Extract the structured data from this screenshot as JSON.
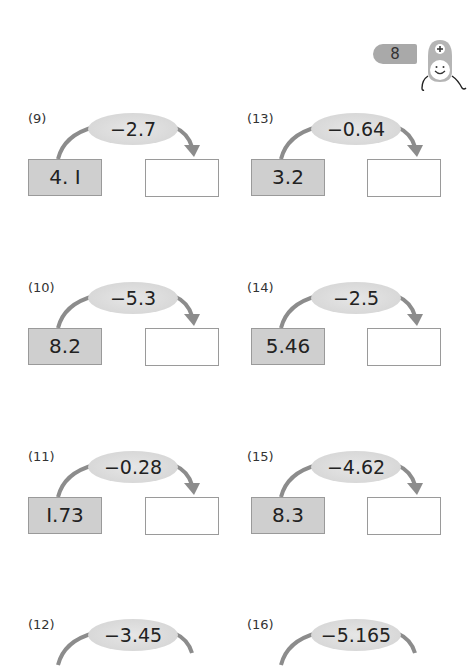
{
  "page": {
    "number_badge": "8",
    "mascot_icon": "plus-mascot-icon",
    "colors": {
      "oval_fill": "#d9d9d9",
      "start_box_fill": "#cfcfcf",
      "border": "#9a9a9a",
      "arrow": "#8c8c8c"
    }
  },
  "problems": [
    {
      "label": "(9)",
      "operation": "−2.7",
      "start": "4. I",
      "answer": ""
    },
    {
      "label": "(10)",
      "operation": "−5.3",
      "start": "8.2",
      "answer": ""
    },
    {
      "label": "(11)",
      "operation": "−0.28",
      "start": "I.73",
      "answer": ""
    },
    {
      "label": "(12)",
      "operation": "−3.45",
      "start": "",
      "answer": ""
    },
    {
      "label": "(13)",
      "operation": "−0.64",
      "start": "3.2",
      "answer": ""
    },
    {
      "label": "(14)",
      "operation": "−2.5",
      "start": "5.46",
      "answer": ""
    },
    {
      "label": "(15)",
      "operation": "−4.62",
      "start": "8.3",
      "answer": ""
    },
    {
      "label": "(16)",
      "operation": "−5.165",
      "start": "",
      "answer": ""
    }
  ]
}
